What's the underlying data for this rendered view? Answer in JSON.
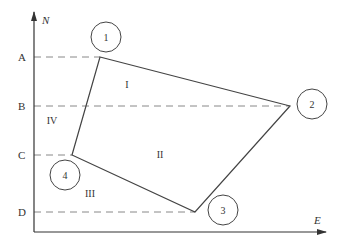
{
  "axes": {
    "y_label": "N",
    "x_label": "E",
    "origin": [
      34,
      232
    ],
    "y_top": 12,
    "x_right": 326
  },
  "ticks": [
    {
      "label": "A",
      "y": 57,
      "x_end": 100
    },
    {
      "label": "B",
      "y": 106,
      "x_end": 290
    },
    {
      "label": "C",
      "y": 155,
      "x_end": 72
    },
    {
      "label": "D",
      "y": 212,
      "x_end": 195
    }
  ],
  "points": [
    {
      "label": "1",
      "x": 100,
      "y": 57,
      "cx": 106,
      "cy": 37
    },
    {
      "label": "2",
      "x": 290,
      "y": 106,
      "cx": 312,
      "cy": 104
    },
    {
      "label": "3",
      "x": 195,
      "y": 212,
      "cx": 223,
      "cy": 210
    },
    {
      "label": "4",
      "x": 72,
      "y": 155,
      "cx": 65,
      "cy": 175
    }
  ],
  "regions": [
    {
      "label": "I",
      "x": 127,
      "y": 88
    },
    {
      "label": "II",
      "x": 160,
      "y": 158
    },
    {
      "label": "III",
      "x": 90,
      "y": 197
    },
    {
      "label": "IV",
      "x": 52,
      "y": 124
    }
  ],
  "colors": {
    "line": "#444444",
    "dash": "#888888"
  }
}
